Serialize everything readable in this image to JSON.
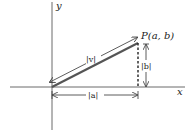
{
  "diagram": {
    "axis_x_label": "x",
    "axis_y_label": "y",
    "point_label": "P(a, b)",
    "vector_magnitude_label": "|v|",
    "horizontal_component_label": "|a|",
    "vertical_component_label": "|b|"
  }
}
